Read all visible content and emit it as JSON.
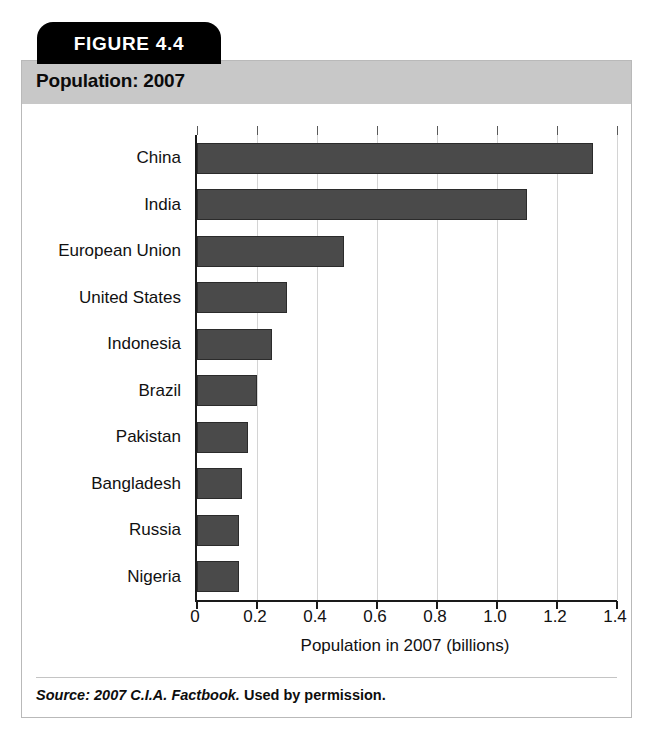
{
  "figure": {
    "tab_label": "FIGURE 4.4",
    "title": "Population: 2007",
    "source_citation": "Source: 2007 C.I.A. Factbook.",
    "source_permission": " Used by permission."
  },
  "colors": {
    "tab_background": "#000000",
    "tab_text": "#ffffff",
    "title_band": "#c8c8c8",
    "bar_fill": "#4a4a4a",
    "bar_stroke": "#2b2b2b",
    "gridline": "#d4d4d4",
    "axis": "#1a1a1a",
    "card_border": "#b9b9b9",
    "page_background": "#ffffff"
  },
  "chart_data": {
    "type": "bar",
    "orientation": "horizontal",
    "title": "Population: 2007",
    "xlabel": "Population in 2007 (billions)",
    "ylabel": "",
    "xlim": [
      0,
      1.4
    ],
    "xticks": [
      "0",
      "0.2",
      "0.4",
      "0.6",
      "0.8",
      "1.0",
      "1.2",
      "1.4"
    ],
    "xtick_values": [
      0,
      0.2,
      0.4,
      0.6,
      0.8,
      1.0,
      1.2,
      1.4
    ],
    "grid": "vertical",
    "legend": "none",
    "categories": [
      "China",
      "India",
      "European Union",
      "United States",
      "Indonesia",
      "Brazil",
      "Pakistan",
      "Bangladesh",
      "Russia",
      "Nigeria"
    ],
    "values": [
      1.32,
      1.1,
      0.49,
      0.3,
      0.25,
      0.2,
      0.17,
      0.15,
      0.14,
      0.14
    ],
    "units": "billions"
  }
}
